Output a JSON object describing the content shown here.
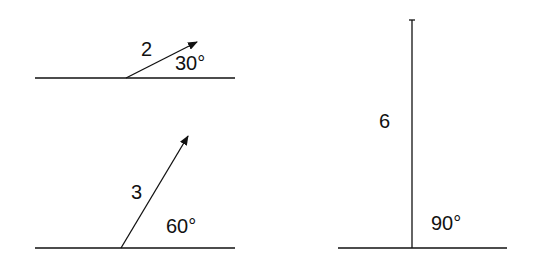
{
  "diagram": {
    "vectors": [
      {
        "magnitude_label": "2",
        "angle_label": "30°"
      },
      {
        "magnitude_label": "3",
        "angle_label": "60°"
      },
      {
        "magnitude_label": "6",
        "angle_label": "90°"
      }
    ],
    "colors": {
      "stroke": "#111111",
      "background": "#ffffff"
    }
  }
}
